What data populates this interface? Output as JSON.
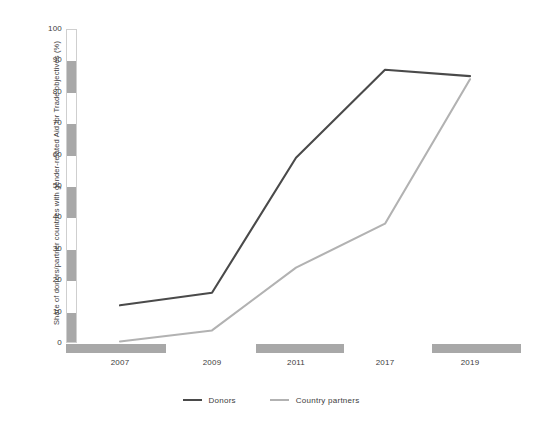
{
  "chart_data": {
    "type": "line",
    "title": "",
    "subtitle": "",
    "xlabel": "",
    "ylabel": "Share of donors/partner countries with gender-related Aid for Trade objectives (%)",
    "categories": [
      "2007",
      "2009",
      "2011",
      "2017",
      "2019"
    ],
    "x": [
      2007,
      2009,
      2011,
      2017,
      2019
    ],
    "xlim": [
      2006,
      2020
    ],
    "ylim": [
      0,
      100
    ],
    "ytick_values": [
      0,
      10,
      20,
      30,
      40,
      50,
      60,
      70,
      80,
      90,
      100
    ],
    "ytick_labels": [
      "0",
      "10",
      "20",
      "30",
      "40",
      "50",
      "60",
      "70",
      "80",
      "90",
      "100"
    ],
    "xtick_labels": [
      "2007",
      "2009",
      "2011",
      "2017",
      "2019"
    ],
    "grid": false,
    "legend_position": "bottom-center",
    "series": [
      {
        "name": "Donors",
        "color": "#4a4a4a",
        "values": [
          12,
          16,
          59,
          87,
          85
        ]
      },
      {
        "name": "Country partners",
        "color": "#b2b2b2",
        "values": [
          0.5,
          4,
          24,
          38,
          84
        ]
      }
    ]
  },
  "axes": {
    "y_axis_band_style": "alternating-gray-white",
    "x_axis_band_style": "alternating-gray-white"
  },
  "legend": {
    "entries": [
      {
        "label": "Donors",
        "color": "#4a4a4a"
      },
      {
        "label": "Country partners",
        "color": "#b2b2b2"
      }
    ]
  },
  "colors": {
    "background": "#ffffff",
    "text": "#3c3c3c",
    "axis_band_gray": "#a8a8a8",
    "axis_band_white": "#ffffff",
    "donors_line": "#4a4a4a",
    "country_partners_line": "#b2b2b2"
  }
}
